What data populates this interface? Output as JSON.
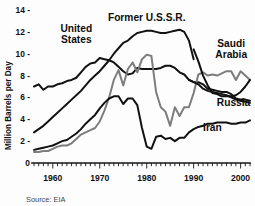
{
  "figure": {
    "source_note": "Source: EIA",
    "background_color": "#fdfdfd"
  },
  "chart_data": {
    "type": "line",
    "title": "",
    "subtitle": "",
    "xlabel": "",
    "ylabel": "Million Barrels per Day",
    "xlim": [
      1956,
      2002
    ],
    "ylim": [
      0,
      14
    ],
    "grid": false,
    "legend_position": "inline-annotations",
    "y_ticks": [
      0,
      2,
      4,
      6,
      8,
      10,
      12,
      14
    ],
    "y_tick_labels": [
      "0",
      "2 -",
      "4 -",
      "6 -",
      "8 -",
      "10 -",
      "12 -",
      "14 -"
    ],
    "x_ticks": [
      1960,
      1970,
      1980,
      1990,
      2000
    ],
    "x_tick_labels": [
      "1960",
      "1970",
      "1980",
      "1990",
      "2000"
    ],
    "x_minor_tick_interval": 1,
    "annotations": [
      {
        "text": "United\nStates",
        "line1": "United",
        "line2": "States",
        "x": 1965.0,
        "y": 12.0,
        "color": "#0d0d0d"
      },
      {
        "text": "Former U.S.S.R.",
        "line1": "Former U.S.S.R.",
        "line2": "",
        "x": 1980.0,
        "y": 13.0,
        "color": "#0d0d0d"
      },
      {
        "text": "Saudi\nArabia",
        "line1": "Saudi",
        "line2": "Arabia",
        "x": 1998.0,
        "y": 10.6,
        "color": "#0d0d0d"
      },
      {
        "text": "Russia",
        "line1": "Russia",
        "line2": "",
        "x": 1998.5,
        "y": 5.2,
        "color": "#0d0d0d"
      },
      {
        "text": "Iran",
        "line1": "Iran",
        "line2": "",
        "x": 1994.0,
        "y": 2.9,
        "color": "#0d0d0d"
      }
    ],
    "series": [
      {
        "name": "United States",
        "label": "United States",
        "color": "#111111",
        "style": "thick-dark",
        "x": [
          1956,
          1957,
          1958,
          1959,
          1960,
          1961,
          1962,
          1963,
          1964,
          1965,
          1966,
          1967,
          1968,
          1969,
          1970,
          1971,
          1972,
          1973,
          1974,
          1975,
          1976,
          1977,
          1978,
          1979,
          1980,
          1981,
          1982,
          1983,
          1984,
          1985,
          1986,
          1987,
          1988,
          1989,
          1990,
          1991,
          1992,
          1993,
          1994,
          1995,
          1996,
          1997,
          1998,
          1999,
          2000,
          2001,
          2002
        ],
        "values": [
          7.0,
          7.2,
          6.7,
          7.0,
          7.0,
          7.2,
          7.3,
          7.5,
          7.6,
          7.8,
          8.3,
          8.8,
          9.1,
          9.2,
          9.6,
          9.5,
          9.4,
          9.2,
          8.8,
          8.4,
          8.1,
          8.2,
          8.7,
          8.6,
          8.6,
          8.6,
          8.6,
          8.7,
          8.9,
          8.9,
          8.7,
          8.3,
          8.1,
          7.6,
          7.4,
          7.4,
          7.2,
          6.8,
          6.7,
          6.6,
          6.5,
          6.5,
          6.3,
          5.9,
          5.8,
          5.8,
          5.7
        ]
      },
      {
        "name": "Former U.S.S.R.",
        "label": "Former U.S.S.R.",
        "color": "#111111",
        "style": "thick-dark",
        "x": [
          1956,
          1957,
          1958,
          1959,
          1960,
          1961,
          1962,
          1963,
          1964,
          1965,
          1966,
          1967,
          1968,
          1969,
          1970,
          1971,
          1972,
          1973,
          1974,
          1975,
          1976,
          1977,
          1978,
          1979,
          1980,
          1981,
          1982,
          1983,
          1984,
          1985,
          1986,
          1987,
          1988,
          1989,
          1990
        ],
        "values": [
          2.8,
          3.1,
          3.4,
          3.8,
          4.2,
          4.6,
          5.0,
          5.4,
          5.8,
          6.2,
          6.6,
          7.1,
          7.6,
          8.0,
          8.4,
          8.9,
          9.4,
          10.0,
          10.5,
          11.0,
          11.2,
          11.6,
          11.9,
          12.0,
          12.1,
          12.1,
          12.0,
          11.9,
          11.9,
          12.0,
          12.1,
          12.2,
          12.0,
          11.2,
          9.5
        ]
      },
      {
        "name": "Saudi Arabia",
        "label": "Saudi Arabia",
        "color": "#7d7d7d",
        "style": "thick-gray",
        "x": [
          1956,
          1957,
          1958,
          1959,
          1960,
          1961,
          1962,
          1963,
          1964,
          1965,
          1966,
          1967,
          1968,
          1969,
          1970,
          1971,
          1972,
          1973,
          1974,
          1975,
          1976,
          1977,
          1978,
          1979,
          1980,
          1981,
          1982,
          1983,
          1984,
          1985,
          1986,
          1987,
          1988,
          1989,
          1990,
          1991,
          1992,
          1993,
          1994,
          1995,
          1996,
          1997,
          1998,
          1999,
          2000,
          2001,
          2002
        ],
        "values": [
          1.0,
          1.0,
          1.1,
          1.1,
          1.3,
          1.5,
          1.6,
          1.6,
          1.8,
          2.2,
          2.6,
          2.8,
          3.0,
          3.2,
          3.8,
          4.8,
          6.0,
          7.6,
          8.5,
          7.1,
          8.6,
          9.2,
          8.3,
          9.5,
          9.9,
          9.8,
          6.5,
          5.1,
          4.7,
          3.4,
          5.1,
          4.3,
          5.1,
          5.1,
          6.4,
          8.1,
          8.3,
          8.0,
          8.1,
          8.0,
          8.2,
          8.4,
          8.4,
          7.6,
          8.4,
          8.0,
          7.6
        ]
      },
      {
        "name": "Russia",
        "label": "Russia",
        "color": "#111111",
        "style": "thick-dark",
        "x": [
          1990,
          1991,
          1992,
          1993,
          1994,
          1995,
          1996,
          1997,
          1998,
          1999,
          2000,
          2001,
          2002
        ],
        "values": [
          10.4,
          9.3,
          8.0,
          7.1,
          6.4,
          6.3,
          6.1,
          6.1,
          6.1,
          6.2,
          6.5,
          7.0,
          7.6
        ]
      },
      {
        "name": "Russia (charted)",
        "label": "Russia",
        "color": "#111111",
        "style": "thick-dark-tail",
        "x": [
          1989,
          1990,
          1991,
          1992,
          1993,
          1994,
          1995,
          1996,
          1997,
          1998,
          1999,
          2000,
          2001,
          2002
        ],
        "values": [
          7.6,
          7.4,
          7.2,
          6.8,
          6.6,
          6.5,
          6.4,
          6.3,
          6.2,
          6.0,
          5.8,
          5.7,
          5.6,
          5.5
        ]
      },
      {
        "name": "Iran",
        "label": "Iran",
        "color": "#111111",
        "style": "thin-dark",
        "x": [
          1956,
          1957,
          1958,
          1959,
          1960,
          1961,
          1962,
          1963,
          1964,
          1965,
          1966,
          1967,
          1968,
          1969,
          1970,
          1971,
          1972,
          1973,
          1974,
          1975,
          1976,
          1977,
          1978,
          1979,
          1980,
          1981,
          1982,
          1983,
          1984,
          1985,
          1986,
          1987,
          1988,
          1989,
          1990,
          1991,
          1992,
          1993,
          1994,
          1995,
          1996,
          1997,
          1998,
          1999,
          2000,
          2001,
          2002
        ],
        "values": [
          1.2,
          1.3,
          1.4,
          1.5,
          1.6,
          1.8,
          2.0,
          2.1,
          2.4,
          2.7,
          3.1,
          3.6,
          4.0,
          4.4,
          5.0,
          5.5,
          5.9,
          6.1,
          6.1,
          5.4,
          5.9,
          5.9,
          5.3,
          3.2,
          1.5,
          1.3,
          2.4,
          2.5,
          2.2,
          2.3,
          2.0,
          2.3,
          2.3,
          2.8,
          3.1,
          3.3,
          3.4,
          3.6,
          3.6,
          3.7,
          3.7,
          3.7,
          3.6,
          3.6,
          3.7,
          3.7,
          3.9
        ]
      }
    ]
  }
}
